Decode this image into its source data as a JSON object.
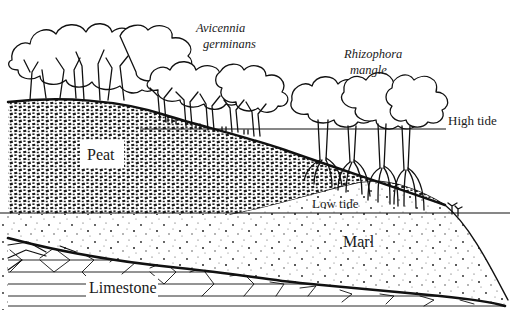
{
  "diagram": {
    "species": [
      {
        "id": "avicennia",
        "line1": "Avicennia",
        "line2": "germinans"
      },
      {
        "id": "rhizophora",
        "line1": "Rhizophora",
        "line2": "mangle"
      }
    ],
    "tide_lines": [
      {
        "id": "high",
        "label": "High tide"
      },
      {
        "id": "low",
        "label": "Low tide"
      }
    ],
    "layers": [
      {
        "id": "peat",
        "label": "Peat"
      },
      {
        "id": "marl",
        "label": "Marl"
      },
      {
        "id": "limestone",
        "label": "Limestone"
      }
    ],
    "colors": {
      "ink": "#111111",
      "background": "#ffffff"
    }
  }
}
